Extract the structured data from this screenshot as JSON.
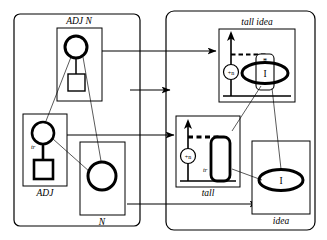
{
  "figure": {
    "type": "diagram",
    "domain": "linguistic-structure-mapping",
    "panels": [
      {
        "id": "syntax",
        "name": "left-panel",
        "role": "syntactic-structures",
        "nodes": [
          {
            "id": "adj-n",
            "label": "ADJ N",
            "label_position": "top",
            "contents": [
              "bold-circle",
              "thin-square"
            ],
            "link": "vertical-line"
          },
          {
            "id": "adj",
            "label": "ADJ",
            "label_position": "bottom",
            "contents": [
              "bold-circle",
              "bold-square"
            ],
            "node_label": "tr",
            "link": "bold-vertical-line"
          },
          {
            "id": "n",
            "label": "N",
            "label_position": "bottom",
            "contents": [
              "bold-circle"
            ]
          }
        ]
      },
      {
        "id": "semantics",
        "name": "right-panel",
        "role": "semantic-structures",
        "nodes": [
          {
            "id": "tall-idea",
            "label": "tall idea",
            "label_position": "top",
            "contents": [
              "axis-arrow",
              "dashed-line",
              "plus-n-circle",
              "rounded-rect-star",
              "bold-ellipse-I"
            ],
            "star_label": "*",
            "ellipse_label": "I",
            "circle_label": "+n"
          },
          {
            "id": "tall",
            "label": "tall",
            "label_position": "bottom",
            "contents": [
              "axis-arrow",
              "bold-dashed-line",
              "plus-n-circle",
              "bold-rounded-rect"
            ],
            "node_label": "tr",
            "circle_label": "+n"
          },
          {
            "id": "idea",
            "label": "idea",
            "label_position": "bottom",
            "contents": [
              "bold-ellipse-I"
            ],
            "ellipse_label": "I"
          }
        ]
      }
    ],
    "mappings": [
      {
        "from": "adj-n",
        "to": "tall-idea",
        "style": "arrow",
        "name": "map-adjn-to-tallidea"
      },
      {
        "from": "adj",
        "to": "tall",
        "style": "arrow",
        "name": "map-adj-to-tall"
      },
      {
        "from": "n",
        "to": "idea",
        "style": "arrow",
        "name": "map-n-to-idea"
      },
      {
        "from": "syntax-panel",
        "to": "semantics-panel",
        "style": "arrow",
        "name": "map-panel-to-panel"
      }
    ],
    "correspondences": [
      {
        "from": "adj-n-circle",
        "to": "adj-circle",
        "style": "thin-line"
      },
      {
        "from": "adj-n-circle",
        "to": "n-circle",
        "style": "thin-line"
      },
      {
        "from": "adj-circle",
        "to": "n-circle",
        "style": "thin-line"
      },
      {
        "from": "tall-idea-ellipse",
        "to": "tall-rect",
        "style": "thin-line"
      },
      {
        "from": "tall-idea-ellipse",
        "to": "idea-ellipse",
        "style": "thin-line"
      }
    ],
    "colors": {
      "ink": "#000000",
      "paper": "#ffffff"
    },
    "labels": {
      "adj_n": "ADJ N",
      "adj": "ADJ",
      "n": "N",
      "tall_idea": "tall idea",
      "tall": "tall",
      "idea": "idea",
      "tr_adj": "tr",
      "tr_tall": "tr",
      "star": "*",
      "i_upper": "I",
      "i_lower": "I",
      "plus_n_top": "+n",
      "plus_n_bottom": "+n"
    }
  }
}
